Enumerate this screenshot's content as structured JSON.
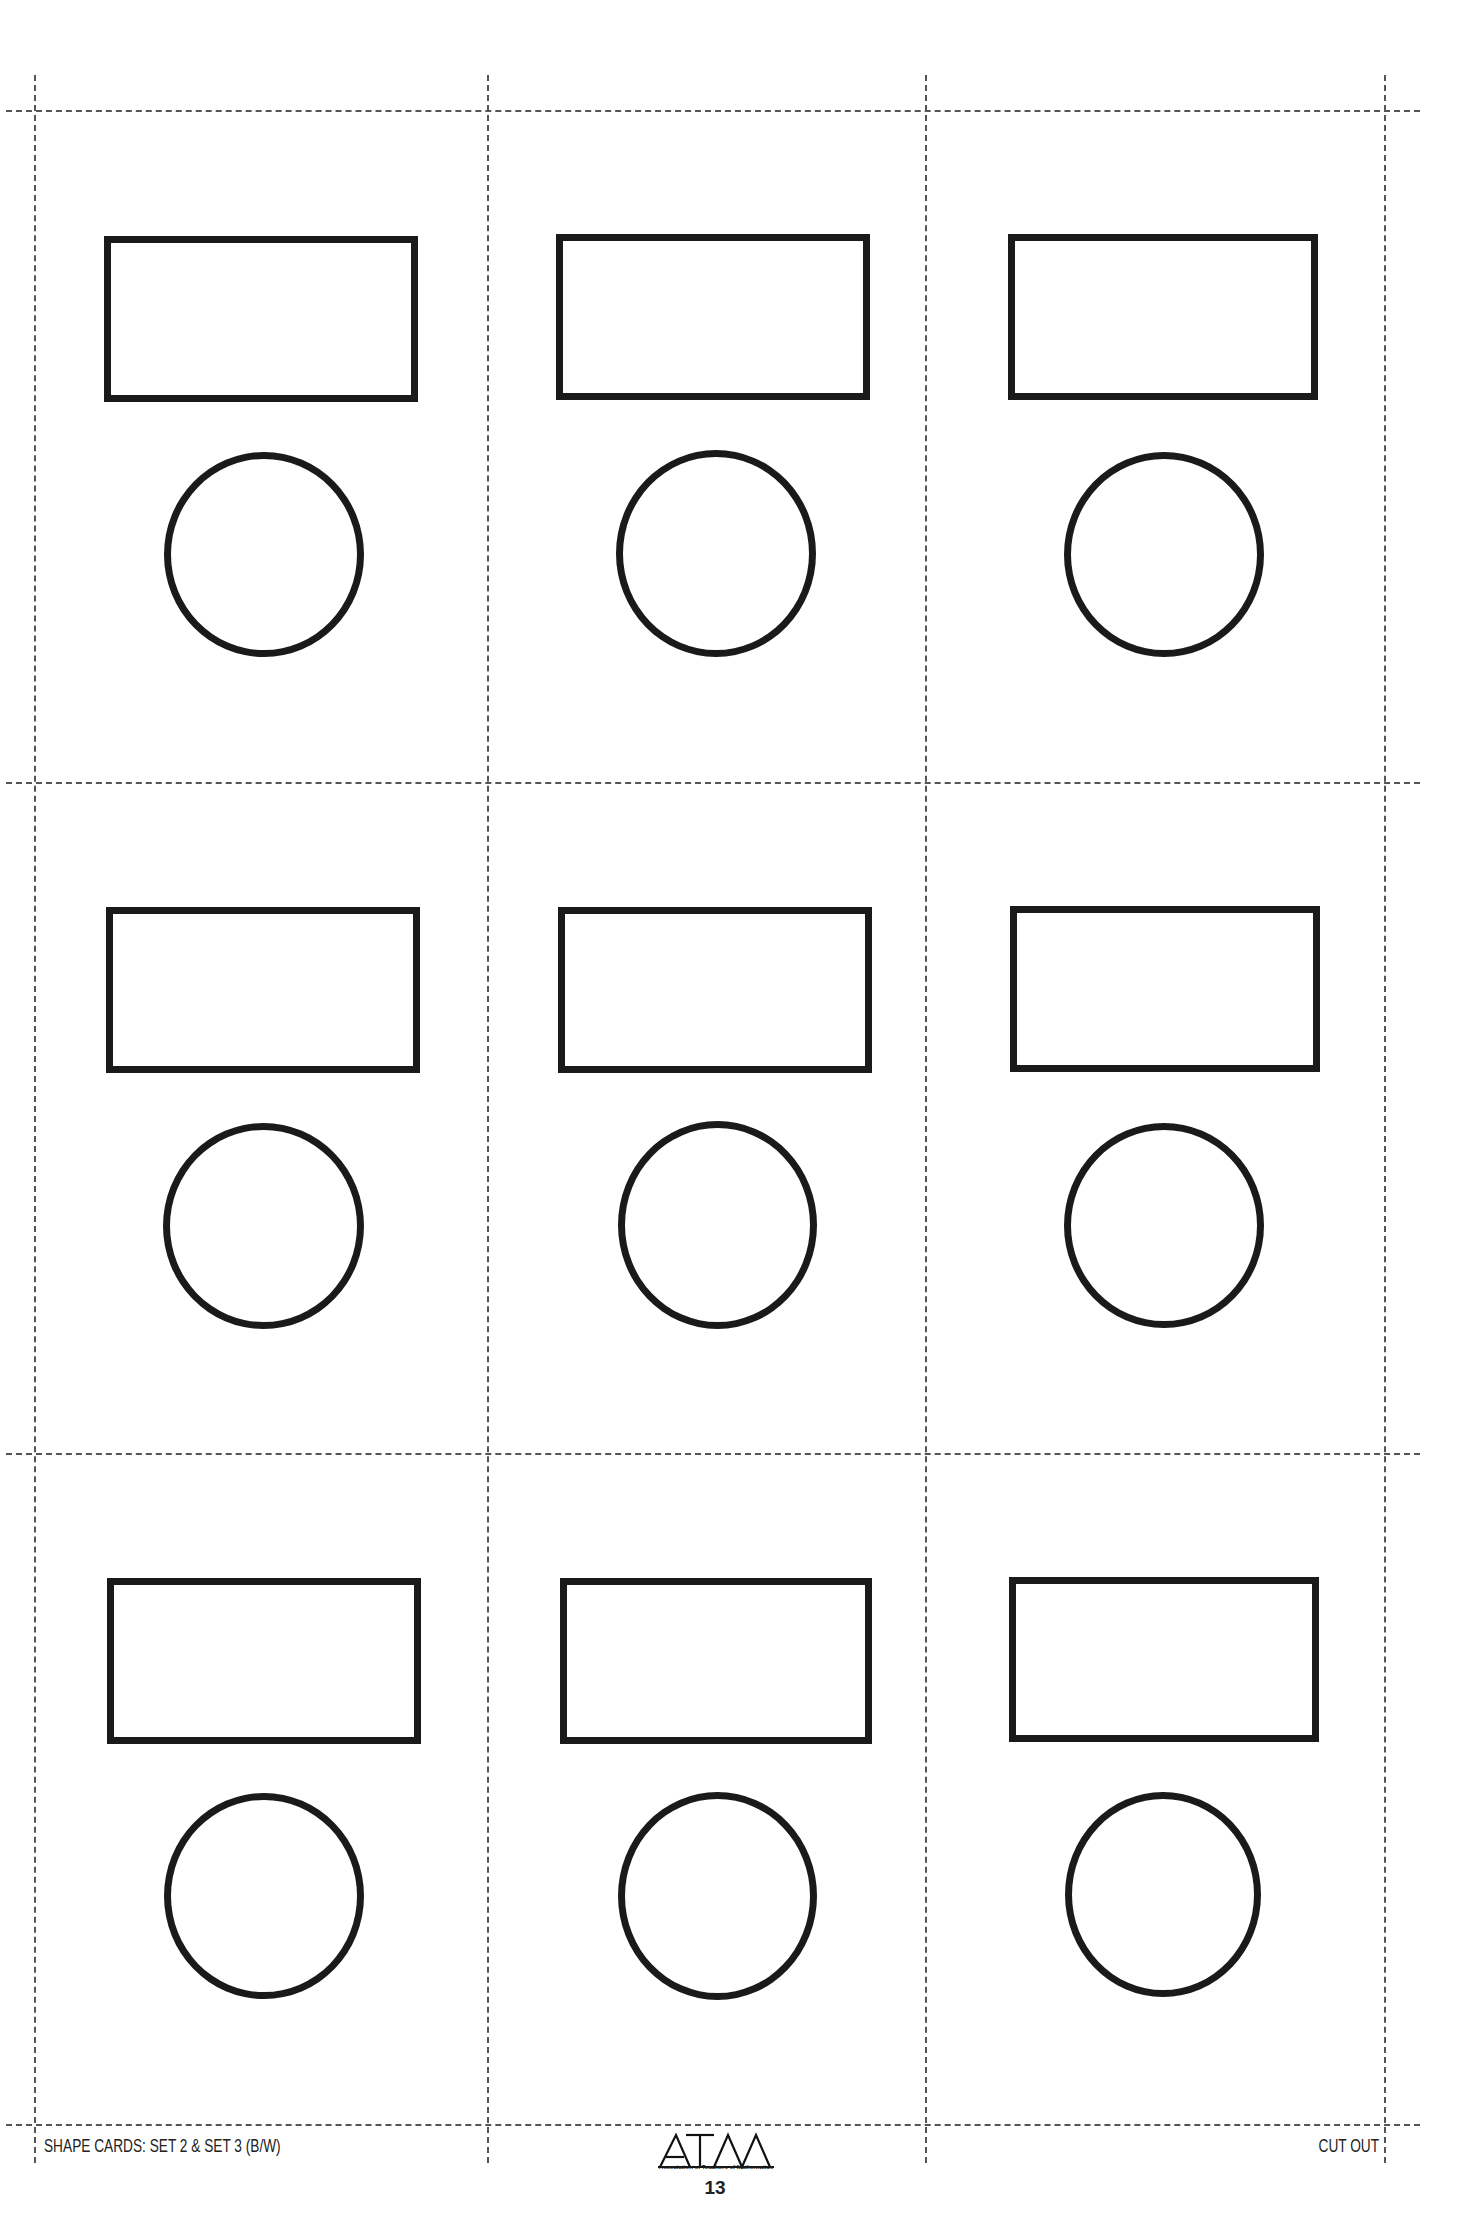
{
  "document": {
    "footer": {
      "title": "SHAPE CARDS: SET 2 & SET 3 (B/W)",
      "instruction": "CUT OUT",
      "logo_text": "ATM",
      "logo_subtitle": "Association of Teachers of Mathematics",
      "page_number": "13"
    },
    "grid": {
      "columns": 3,
      "rows": 3,
      "vertical_lines_x": [
        34,
        487,
        925,
        1384
      ],
      "horizontal_lines_y": [
        110,
        782,
        1453,
        2124
      ]
    },
    "cards": [
      {
        "row": 1,
        "col": 1,
        "shapes": [
          "rectangle",
          "circle"
        ]
      },
      {
        "row": 1,
        "col": 2,
        "shapes": [
          "rectangle",
          "circle"
        ]
      },
      {
        "row": 1,
        "col": 3,
        "shapes": [
          "rectangle",
          "circle"
        ]
      },
      {
        "row": 2,
        "col": 1,
        "shapes": [
          "rectangle",
          "circle"
        ]
      },
      {
        "row": 2,
        "col": 2,
        "shapes": [
          "rectangle",
          "circle"
        ]
      },
      {
        "row": 2,
        "col": 3,
        "shapes": [
          "rectangle",
          "circle"
        ]
      },
      {
        "row": 3,
        "col": 1,
        "shapes": [
          "rectangle",
          "circle"
        ]
      },
      {
        "row": 3,
        "col": 2,
        "shapes": [
          "rectangle",
          "circle"
        ]
      },
      {
        "row": 3,
        "col": 3,
        "shapes": [
          "rectangle",
          "circle"
        ]
      }
    ],
    "colors": {
      "stroke": "#1a1a1a",
      "cut_line": "#555555",
      "background": "#ffffff"
    }
  }
}
